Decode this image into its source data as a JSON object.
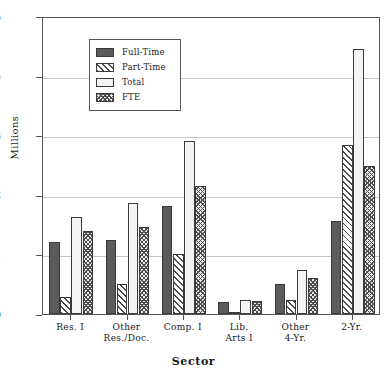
{
  "chart_data": {
    "type": "bar",
    "title": "",
    "xlabel": "Sector",
    "ylabel": "Millions",
    "ylim": [
      0,
      5
    ],
    "yticks": [
      0,
      1,
      2,
      3,
      4,
      5
    ],
    "grid": true,
    "legend_position": "upper-left",
    "categories": [
      "Res. I",
      "Other\nRes./Doc.",
      "Comp. I",
      "Lib.\nArts I",
      "Other\n4-Yr.",
      "2-Yr."
    ],
    "series": [
      {
        "name": "Full-Time",
        "pattern": "solid-dark",
        "values": [
          1.21,
          1.25,
          1.82,
          0.2,
          0.5,
          1.56
        ]
      },
      {
        "name": "Part-Time",
        "pattern": "diagonal",
        "values": [
          0.29,
          0.5,
          1.01,
          0.03,
          0.24,
          2.84
        ]
      },
      {
        "name": "Total",
        "pattern": "light-dots",
        "values": [
          1.63,
          1.87,
          2.91,
          0.24,
          0.74,
          4.45
        ]
      },
      {
        "name": "FTE",
        "pattern": "cross-hatch",
        "values": [
          1.39,
          1.46,
          2.15,
          0.21,
          0.6,
          2.49
        ]
      }
    ]
  },
  "legend": {
    "entries": [
      {
        "label": "Full-Time"
      },
      {
        "label": "Part-Time"
      },
      {
        "label": "Total"
      },
      {
        "label": "FTE"
      }
    ]
  },
  "axes": {
    "y_title": "Millions",
    "x_title": "Sector",
    "y_tick_labels": [
      "5",
      "4",
      "3",
      "2",
      "1",
      "0"
    ],
    "x_tick_labels": [
      [
        "Res. I",
        ""
      ],
      [
        "Other",
        "Res./Doc."
      ],
      [
        "Comp. I",
        ""
      ],
      [
        "Lib.",
        "Arts I"
      ],
      [
        "Other",
        "4-Yr."
      ],
      [
        "2-Yr.",
        ""
      ]
    ]
  },
  "colors": {
    "axis": "#555555",
    "grid": "#c9c9c9",
    "bar_outline": "#3a3a3a",
    "full_time": "#5b5b5b",
    "part_time": "#4a4a4a",
    "total": "#f4f4f4",
    "fte": "#4f4f4f",
    "background": "#ffffff"
  }
}
